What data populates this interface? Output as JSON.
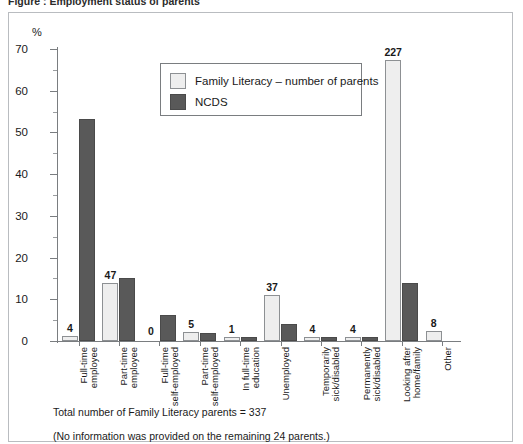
{
  "caption": "Figure : Employment status of parents",
  "axis": {
    "y_unit_label": "%",
    "y_ticks": [
      "0",
      "10",
      "20",
      "30",
      "40",
      "50",
      "60",
      "70"
    ]
  },
  "legend": {
    "entries": [
      {
        "label": "Family Literacy – number of parents",
        "color": "#eeeeee",
        "swatch": "light"
      },
      {
        "label": "NCDS",
        "color": "#595959",
        "swatch": "dark"
      }
    ]
  },
  "footnotes": {
    "total": "Total number of Family Literacy parents = 337",
    "missing": "(No information was provided on the remaining 24 parents.)"
  },
  "chart_data": {
    "type": "bar",
    "title": "Employment status of parents",
    "xlabel": "",
    "ylabel": "%",
    "ylim": [
      0,
      70
    ],
    "ytick_step": 10,
    "yminor_step": 5,
    "grid": false,
    "legend_position": "inside-top-center",
    "categories": [
      "Full-time\nemployee",
      "Part-time\nemployee",
      "Full-time\nself-employed",
      "Part-time\nself-employed",
      "In full-time\neducation",
      "Unemployed",
      "Temporarily\nsick/disabled",
      "Permanently\nsick/disabled",
      "Looking after\nhome/family",
      "Other"
    ],
    "series": [
      {
        "name": "Family Literacy – number of parents",
        "values": [
          1.2,
          14.0,
          0.0,
          2.2,
          1.0,
          11.0,
          1.0,
          1.0,
          67.4,
          2.4
        ],
        "data_labels": [
          "4",
          "47",
          "0",
          "5",
          "1",
          "37",
          "4",
          "4",
          "227",
          "8"
        ]
      },
      {
        "name": "NCDS",
        "values": [
          53.2,
          15.0,
          6.3,
          2.0,
          1.0,
          4.0,
          1.0,
          1.0,
          14.0,
          0.0
        ],
        "data_labels": [
          "",
          "",
          "",
          "",
          "",
          "",
          "",
          "",
          "",
          ""
        ]
      }
    ]
  }
}
